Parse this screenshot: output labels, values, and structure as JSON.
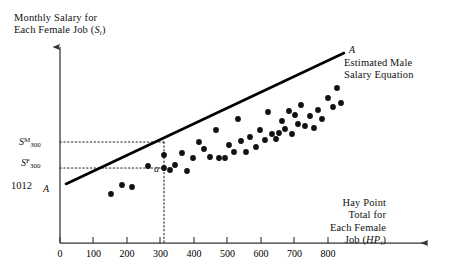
{
  "figure": {
    "y_axis_title_line1": "Monthly Salary for",
    "y_axis_title_line2_prefix": "Each Female Job (",
    "y_axis_title_var": "S",
    "y_axis_title_sub": "i",
    "y_axis_title_line2_suffix": ")",
    "x_axis_title_line1": "Hay Point",
    "x_axis_title_line2": "Total for",
    "x_axis_title_line3": "Each Female",
    "x_axis_title_line4_prefix": "Job (",
    "x_axis_title_var": "HP",
    "x_axis_title_sub": "i",
    "x_axis_title_line4_suffix": ")",
    "line_label_top": "A",
    "line_label_bottom": "A",
    "caption_line1": "Estimated Male",
    "caption_line2": "Salary Equation",
    "intercept_label": "1012",
    "point_a_label": "a",
    "sm_base": "S",
    "sm_sup": "M",
    "sm_sub": "300",
    "sf_base": "S",
    "sf_sup": "F",
    "sf_sub": "300",
    "origin_label": "0",
    "colors": {
      "ink": "#111111",
      "axis": "#333333",
      "regression_line": "#000000",
      "point_fill": "#111111",
      "guide_dotted": "#222222"
    }
  },
  "chart_data": {
    "type": "scatter",
    "title": "",
    "xlabel": "Hay Point Total for Each Female Job (HP_i)",
    "ylabel": "Monthly Salary for Each Female Job (S_i)",
    "xlim": [
      0,
      880
    ],
    "ylim": [
      0,
      3400
    ],
    "xticks": [
      0,
      100,
      200,
      300,
      400,
      500,
      600,
      700,
      800
    ],
    "xtick_labels": [
      "0",
      "100",
      "200",
      "300",
      "400",
      "500",
      "600",
      "700",
      "800"
    ],
    "yticks": [],
    "grid": false,
    "legend": null,
    "annotations": [
      {
        "text": "A",
        "role": "line-endpoint-upper",
        "x": 800,
        "y": 2980
      },
      {
        "text": "A",
        "role": "line-endpoint-lower",
        "x": 35,
        "y": 1080
      },
      {
        "text": "Estimated Male Salary Equation",
        "role": "line-caption",
        "x": 790,
        "y": 2760
      },
      {
        "text": "1012",
        "role": "y-intercept-value",
        "x": 0,
        "y": 1012
      },
      {
        "text": "a",
        "role": "female-point-at-300",
        "x": 310,
        "y": 1480
      },
      {
        "text": "S^M_300",
        "role": "male-salary-at-300-haypoints",
        "x": 0,
        "y": 1830
      },
      {
        "text": "S^F_300",
        "role": "female-salary-at-300-haypoints",
        "x": 0,
        "y": 1480
      }
    ],
    "series": [
      {
        "name": "Estimated Male Salary Equation",
        "type": "line",
        "x": [
          18,
          800
        ],
        "y": [
          1060,
          2980
        ]
      },
      {
        "name": "Female Jobs",
        "type": "scatter",
        "points": [
          [
            152,
            1060
          ],
          [
            186,
            1245
          ],
          [
            214,
            1215
          ],
          [
            262,
            1620
          ],
          [
            300,
            1480
          ],
          [
            315,
            1440
          ],
          [
            330,
            1575
          ],
          [
            352,
            1530
          ],
          [
            362,
            1395
          ],
          [
            378,
            1700
          ],
          [
            392,
            1570
          ],
          [
            405,
            1905
          ],
          [
            418,
            1760
          ],
          [
            432,
            1600
          ],
          [
            448,
            2160
          ],
          [
            452,
            1580
          ],
          [
            468,
            1575
          ],
          [
            478,
            1830
          ],
          [
            488,
            1690
          ],
          [
            498,
            2290
          ],
          [
            505,
            1865
          ],
          [
            518,
            1690
          ],
          [
            528,
            1960
          ],
          [
            540,
            1775
          ],
          [
            552,
            2100
          ],
          [
            565,
            1930
          ],
          [
            572,
            2410
          ],
          [
            582,
            2010
          ],
          [
            592,
            1925
          ],
          [
            600,
            2030
          ],
          [
            608,
            2250
          ],
          [
            615,
            2105
          ],
          [
            625,
            2430
          ],
          [
            632,
            1995
          ],
          [
            640,
            2340
          ],
          [
            648,
            2180
          ],
          [
            655,
            2520
          ],
          [
            668,
            2155
          ],
          [
            678,
            2320
          ],
          [
            690,
            2100
          ],
          [
            700,
            2430
          ],
          [
            712,
            2265
          ],
          [
            728,
            2640
          ],
          [
            742,
            2480
          ],
          [
            752,
            2820
          ],
          [
            762,
            2560
          ]
        ]
      }
    ],
    "guides": [
      {
        "type": "vline",
        "x": 310,
        "y_from": 0,
        "y_to": 1830,
        "style": "dotted"
      },
      {
        "type": "hline",
        "y": 1830,
        "x_from": 0,
        "x_to": 310,
        "style": "dotted"
      },
      {
        "type": "hline",
        "y": 1480,
        "x_from": 0,
        "x_to": 310,
        "style": "dotted"
      }
    ]
  }
}
